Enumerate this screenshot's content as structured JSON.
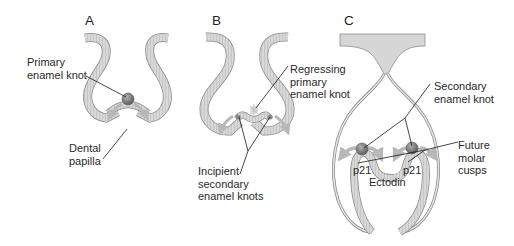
{
  "panels": [
    {
      "id": "A",
      "label": "A"
    },
    {
      "id": "B",
      "label": "B"
    },
    {
      "id": "C",
      "label": "C"
    }
  ],
  "labels": {
    "primary_enamel_knot": "Primary\nenamel knot",
    "dental_papilla": "Dental\npapilla",
    "regressing_primary_enamel_knot": "Regressing\nprimary\nenamel knot",
    "incipient_secondary_enamel_knots": "Incipient\nsecondary\nenamel knots",
    "secondary_enamel_knot": "Secondary\nenamel knot",
    "future_molar_cusps": "Future\nmolar\ncusps",
    "p21_left": "p21",
    "p21_right": "p21",
    "ectodin": "Ectodin"
  },
  "colors": {
    "epithelium_fill": "#d6d6d6",
    "epithelium_stroke": "#8a8a8a",
    "knot_fill": "#7a7a7a",
    "signal_arrow": "#b8b8b8",
    "leader_line": "#1a1a1a"
  }
}
